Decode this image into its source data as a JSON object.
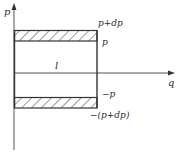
{
  "diagram": {
    "type": "p-q plane strip diagram",
    "axes": {
      "vertical": {
        "label": "p"
      },
      "horizontal": {
        "label": "q"
      }
    },
    "length_label": "l",
    "top_band": {
      "upper_label": "p+dp",
      "lower_label": "p"
    },
    "bottom_band": {
      "upper_label": "−p",
      "lower_label": "−(p+dp)"
    },
    "colors": {
      "line": "#3a3a3a",
      "hatch": "#3a3a3a",
      "background": "#ffffff"
    }
  }
}
